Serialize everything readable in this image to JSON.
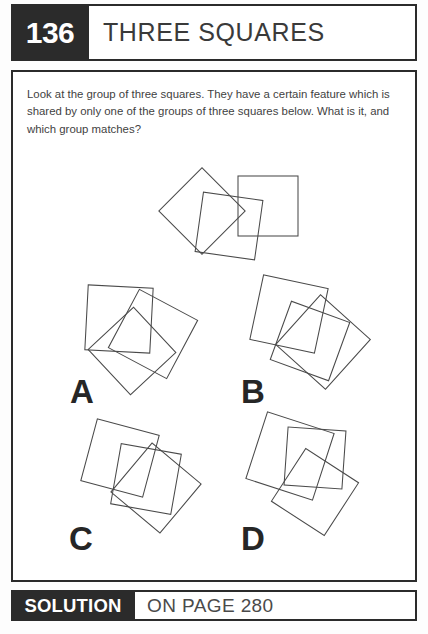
{
  "header": {
    "number": "136",
    "title": "THREE SQUARES"
  },
  "instructions": {
    "text": "Look at the group of three squares. They have a certain feature which is shared by only one of the groups of three squares below. What is it, and which group matches?"
  },
  "figures": {
    "reference": {
      "name": "reference-group",
      "squares": [
        {
          "cx": 61,
          "cy": 49,
          "size": 61,
          "angle": 45
        },
        {
          "cx": 88,
          "cy": 64,
          "size": 60,
          "angle": 8
        },
        {
          "cx": 127,
          "cy": 44,
          "size": 60,
          "angle": 0
        }
      ]
    },
    "options": [
      {
        "label": "A",
        "name": "option-a",
        "squares": [
          {
            "cx": 54,
            "cy": 42,
            "size": 65,
            "angle": 3
          },
          {
            "cx": 88,
            "cy": 57,
            "size": 66,
            "angle": 28
          },
          {
            "cx": 67,
            "cy": 74,
            "size": 62,
            "angle": 47
          }
        ]
      },
      {
        "label": "B",
        "name": "option-b",
        "squares": [
          {
            "cx": 52,
            "cy": 34,
            "size": 66,
            "angle": 12
          },
          {
            "cx": 73,
            "cy": 61,
            "size": 62,
            "angle": 20
          },
          {
            "cx": 86,
            "cy": 62,
            "size": 67,
            "angle": 42
          }
        ]
      },
      {
        "label": "C",
        "name": "option-c",
        "squares": [
          {
            "cx": 52,
            "cy": 38,
            "size": 64,
            "angle": 15
          },
          {
            "cx": 78,
            "cy": 59,
            "size": 61,
            "angle": 10
          },
          {
            "cx": 88,
            "cy": 68,
            "size": 64,
            "angle": 40
          }
        ]
      },
      {
        "label": "D",
        "name": "option-d",
        "squares": [
          {
            "cx": 53,
            "cy": 40,
            "size": 70,
            "angle": 18
          },
          {
            "cx": 78,
            "cy": 42,
            "size": 58,
            "angle": 4
          },
          {
            "cx": 78,
            "cy": 76,
            "size": 63,
            "angle": 33
          }
        ]
      }
    ]
  },
  "footer": {
    "label": "SOLUTION",
    "value": "ON PAGE 280"
  }
}
